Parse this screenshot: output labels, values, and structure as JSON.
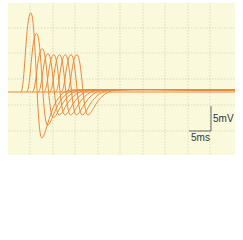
{
  "chart_data": {
    "type": "line",
    "title": "",
    "xlabel": "",
    "ylabel": "",
    "grid": true,
    "background": "#fbf9dc",
    "trace_color": "#e8893a",
    "scale_bar": {
      "voltage": "5mV",
      "time": "5ms"
    },
    "series": [
      {
        "name": "trace-1",
        "peak_x_ms": 3.0,
        "peak_mv": 15.5,
        "trough_mv": -9.0
      },
      {
        "name": "trace-2",
        "peak_x_ms": 4.6,
        "peak_mv": 11.5,
        "trough_mv": -6.5
      },
      {
        "name": "trace-3",
        "peak_x_ms": 6.2,
        "peak_mv": 8.5,
        "trough_mv": -5.0
      },
      {
        "name": "trace-4",
        "peak_x_ms": 7.8,
        "peak_mv": 7.5,
        "trough_mv": -4.5
      },
      {
        "name": "trace-5",
        "peak_x_ms": 9.4,
        "peak_mv": 7.3,
        "trough_mv": -4.5
      },
      {
        "name": "trace-6",
        "peak_x_ms": 11.0,
        "peak_mv": 7.3,
        "trough_mv": -4.5
      },
      {
        "name": "trace-7",
        "peak_x_ms": 12.6,
        "peak_mv": 7.3,
        "trough_mv": -4.5
      },
      {
        "name": "trace-8",
        "peak_x_ms": 14.2,
        "peak_mv": 7.3,
        "trough_mv": -4.5
      },
      {
        "name": "trace-9",
        "peak_x_ms": 15.8,
        "peak_mv": 7.3,
        "trough_mv": -4.5
      }
    ]
  },
  "labels": {
    "voltage": "5mV",
    "time": "5ms"
  }
}
